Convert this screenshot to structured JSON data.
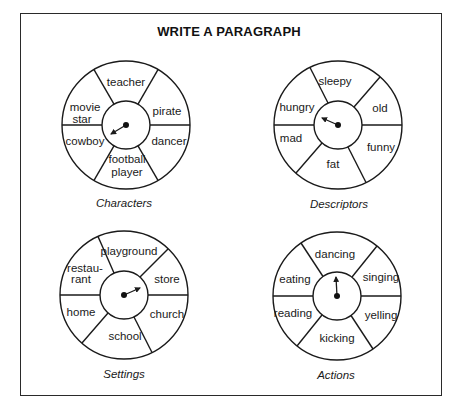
{
  "worksheet": {
    "title": "WRITE A PARAGRAPH"
  },
  "wheels": [
    {
      "caption": "Characters",
      "segments": {
        "top": "teacher",
        "upper_right": "pirate",
        "lower_right": "dancer",
        "bottom": [
          "football",
          "player"
        ],
        "lower_left": "cowboy",
        "upper_left": [
          "movie",
          "star"
        ]
      },
      "spinner_points_to": "cowboy"
    },
    {
      "caption": "Descriptors",
      "segments": {
        "top": "sleepy",
        "upper_right": "old",
        "lower_right": "funny",
        "bottom": "fat",
        "lower_left": "mad",
        "upper_left": "hungry"
      },
      "spinner_points_to": "hungry"
    },
    {
      "caption": "Settings",
      "segments": {
        "top": "playground",
        "upper_right": "store",
        "lower_right": "church",
        "bottom": "school",
        "lower_left": "home",
        "upper_left": [
          "restau-",
          "rant"
        ]
      },
      "spinner_points_to": "store"
    },
    {
      "caption": "Actions",
      "segments": {
        "top": "dancing",
        "upper_right": "singing",
        "lower_right": "yelling",
        "bottom": "kicking",
        "lower_left": "reading",
        "upper_left": "eating"
      },
      "spinner_points_to": "dancing"
    }
  ]
}
